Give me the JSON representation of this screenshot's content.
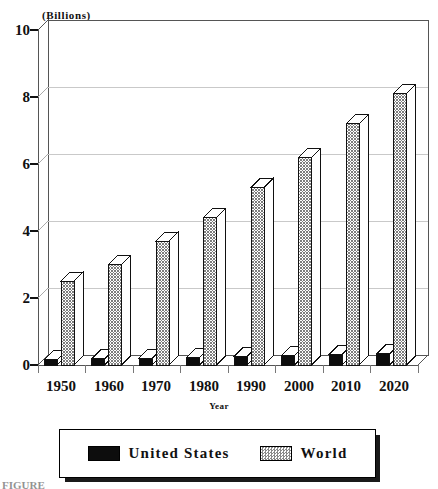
{
  "chart_data": {
    "type": "bar",
    "title": "",
    "subtitle": "",
    "unit_label": "(Billions)",
    "xlabel": "Year",
    "ylabel": "",
    "ylim": [
      0,
      10
    ],
    "yticks": [
      0,
      2,
      4,
      6,
      8,
      10
    ],
    "grid": true,
    "legend_position": "bottom",
    "style": "3d-bar",
    "categories": [
      "1950",
      "1960",
      "1970",
      "1980",
      "1990",
      "2000",
      "2010",
      "2020"
    ],
    "series": [
      {
        "name": "United States",
        "color": "#0d0d0d",
        "pattern": "solid-black",
        "values": [
          0.15,
          0.18,
          0.2,
          0.23,
          0.25,
          0.28,
          0.31,
          0.33
        ]
      },
      {
        "name": "World",
        "color": "#8a8a8a",
        "pattern": "checkered-gray",
        "values": [
          2.5,
          3.0,
          3.7,
          4.4,
          5.3,
          6.2,
          7.2,
          8.1
        ]
      }
    ]
  },
  "axes": {
    "y_unit_caption": "(Billions)",
    "x_axis_title": "Year",
    "y_tick_labels": [
      "10",
      "8",
      "6",
      "4",
      "2",
      "0"
    ],
    "x_tick_labels": [
      "1950",
      "1960",
      "1970",
      "1980",
      "1990",
      "2000",
      "2010",
      "2020"
    ]
  },
  "legend": {
    "entries": [
      {
        "label": "United States",
        "swatch": "solid-black-swatch"
      },
      {
        "label": "World",
        "swatch": "checkered-gray-swatch"
      }
    ]
  },
  "caption": {
    "text": "FIGURE"
  }
}
